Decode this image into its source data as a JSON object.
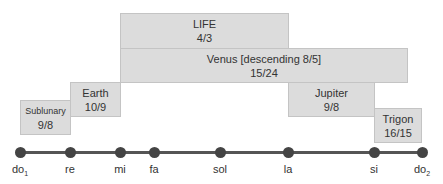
{
  "boxes": [
    {
      "id": "life",
      "name": "LIFE",
      "ratio": "4/3"
    },
    {
      "id": "venus",
      "name": "Venus [descending 8/5]",
      "ratio": "15/24"
    },
    {
      "id": "earth",
      "name": "Earth",
      "ratio": "10/9"
    },
    {
      "id": "sublunary",
      "name": "Sublunary",
      "ratio": "9/8"
    },
    {
      "id": "jupiter",
      "name": "Jupiter",
      "ratio": "9/8"
    },
    {
      "id": "trigon",
      "name": "Trigon",
      "ratio": "16/15"
    }
  ],
  "notes": [
    {
      "base": "do",
      "sub": "1"
    },
    {
      "base": "re",
      "sub": ""
    },
    {
      "base": "mi",
      "sub": ""
    },
    {
      "base": "fa",
      "sub": ""
    },
    {
      "base": "sol",
      "sub": ""
    },
    {
      "base": "la",
      "sub": ""
    },
    {
      "base": "si",
      "sub": ""
    },
    {
      "base": "do",
      "sub": "2"
    }
  ],
  "colors": {
    "box_fill": "#dcdcdc",
    "box_border": "#c4c4c4",
    "line": "#555555",
    "dot": "#444444"
  }
}
